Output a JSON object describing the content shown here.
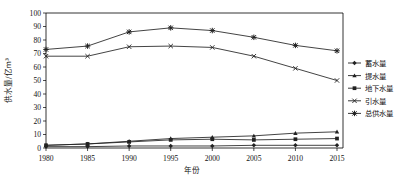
{
  "chart_data": {
    "type": "line",
    "title": "",
    "xlabel": "年份",
    "ylabel": "供水量/亿m³",
    "categories": [
      "1980",
      "1985",
      "1990",
      "1995",
      "2000",
      "2005",
      "2010",
      "2015"
    ],
    "x": [
      1980,
      1985,
      1990,
      1995,
      2000,
      2005,
      2010,
      2015
    ],
    "ylim": [
      0,
      100
    ],
    "yticks": [
      0,
      10,
      20,
      30,
      40,
      50,
      60,
      70,
      80,
      90,
      100
    ],
    "grid": false,
    "legend_position": "right",
    "series": [
      {
        "name": "蓄水量",
        "marker": "diamond",
        "values": [
          1,
          1,
          1.5,
          1.5,
          1.5,
          2,
          2,
          2
        ]
      },
      {
        "name": "提水量",
        "marker": "triangle",
        "values": [
          2,
          3,
          5,
          7,
          8,
          9,
          11,
          12
        ]
      },
      {
        "name": "地下水量",
        "marker": "square",
        "values": [
          2,
          3,
          4.5,
          6,
          6.5,
          6,
          6.5,
          7
        ]
      },
      {
        "name": "引水量",
        "marker": "cross",
        "values": [
          68,
          68,
          75,
          75.5,
          74.5,
          68,
          59,
          50
        ]
      },
      {
        "name": "总供水量",
        "marker": "asterisk",
        "values": [
          73,
          75.5,
          86,
          89,
          87,
          82,
          76,
          72
        ]
      }
    ]
  },
  "axes": {
    "y_tick_labels": [
      "0",
      "10",
      "20",
      "30",
      "40",
      "50",
      "60",
      "70",
      "80",
      "90",
      "100"
    ],
    "x_tick_labels": [
      "1980",
      "1985",
      "1990",
      "1995",
      "2000",
      "2005",
      "2010",
      "2015"
    ],
    "y_axis_title": "供水量/亿m³",
    "x_axis_title": "年份"
  },
  "legend": {
    "items": [
      {
        "label": "蓄水量",
        "marker": "diamond"
      },
      {
        "label": "提水量",
        "marker": "triangle"
      },
      {
        "label": "地下水量",
        "marker": "square"
      },
      {
        "label": "引水量",
        "marker": "cross"
      },
      {
        "label": "总供水量",
        "marker": "asterisk"
      }
    ]
  },
  "colors": {
    "line": "#222222",
    "axis": "#000000",
    "text": "#111111"
  }
}
